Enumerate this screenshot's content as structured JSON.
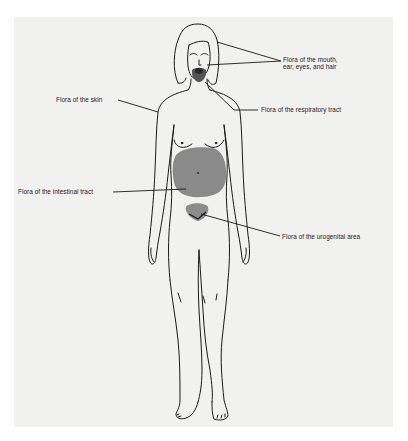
{
  "diagram": {
    "background_color": "#f1f1f0",
    "flora_region_color": "#8a8a8a",
    "line_color": "#1a1a1a",
    "labels": {
      "mouth": "Flora of the mouth,\near, eyes, and hair",
      "skin": "Flora of the skin",
      "respiratory": "Flora of the respiratory tract",
      "intestinal": "Flora of the intestinal tract",
      "urogenital": "Flora of the urogenital area"
    }
  }
}
